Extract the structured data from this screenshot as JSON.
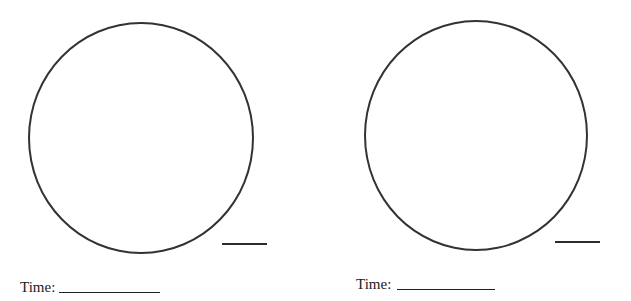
{
  "worksheet": {
    "items": [
      {
        "clock": "blank-clock-face",
        "time_label": "Time:",
        "time_value": "",
        "answer_value": ""
      },
      {
        "clock": "blank-clock-face",
        "time_label": "Time:",
        "time_value": "",
        "answer_value": ""
      }
    ]
  }
}
